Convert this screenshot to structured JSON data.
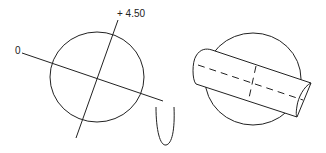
{
  "diagram": {
    "left_figure": {
      "description": "circle with two crossing axes",
      "axis_label_zero": "0",
      "axis_label_tilt": "+ 4.50"
    },
    "connector": {
      "description": "U-shaped curve"
    },
    "right_figure": {
      "description": "circle with cylinder lying across it, dashed centerlines"
    },
    "stroke_color": "#222222",
    "background_color": "#ffffff"
  }
}
